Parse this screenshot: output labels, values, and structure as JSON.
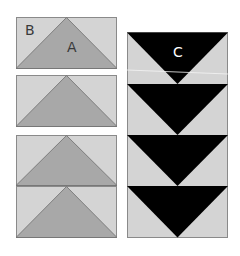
{
  "colors": {
    "background_light": "#d4d4d4",
    "triangle_mid": "#a8a8a8",
    "triangle_dark": "#000000",
    "outline": "#8a8a8a",
    "label_dark": "#3a3a3a",
    "label_light": "#ffffff"
  },
  "labels": {
    "b": "B",
    "a": "A",
    "c": "C"
  },
  "left_column": {
    "blocks": [
      {
        "x": 16,
        "y": 17,
        "w": 101,
        "h": 52,
        "label_a": true,
        "label_b": true
      },
      {
        "x": 16,
        "y": 75,
        "w": 101,
        "h": 52
      },
      {
        "x": 16,
        "y": 135,
        "w": 101,
        "h": 51
      },
      {
        "x": 16,
        "y": 186,
        "w": 101,
        "h": 52
      }
    ]
  },
  "right_column": {
    "x": 127,
    "y": 32,
    "w": 101,
    "h": 206,
    "units": 4,
    "label": "C"
  }
}
